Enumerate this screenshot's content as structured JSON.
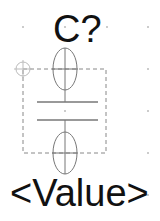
{
  "component": {
    "type": "capacitor",
    "reference": "C?",
    "value": "<Value>"
  },
  "colors": {
    "symbol_stroke": "#777777",
    "body_dashed": "#888888",
    "grid_dot": "#cccccc",
    "pin_marker": "#bbbbbb",
    "text": "#111111"
  },
  "icons": {
    "pin": "crosshair-circle",
    "grid": "dot"
  }
}
